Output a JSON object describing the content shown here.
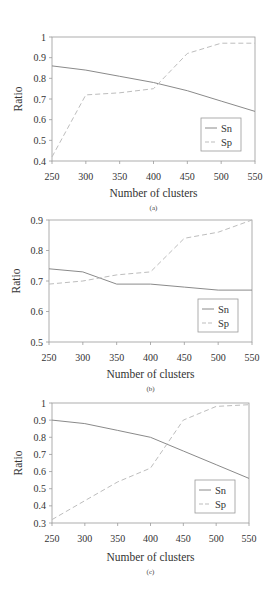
{
  "chart_data": [
    {
      "type": "line",
      "caption": "(a)",
      "title": "",
      "xlabel": "Number of clusters",
      "ylabel": "Ratio",
      "x": [
        250,
        300,
        350,
        400,
        450,
        500,
        550
      ],
      "ylim": [
        0.4,
        1.0
      ],
      "yticks": [
        "0.4",
        "0.5",
        "0.6",
        "0.7",
        "0.8",
        "0.9",
        "1"
      ],
      "xticks": [
        "250",
        "300",
        "350",
        "400",
        "450",
        "500",
        "550"
      ],
      "grid": false,
      "legend_position": "lower right",
      "series": [
        {
          "name": "Sn",
          "style": "solid",
          "values": [
            0.86,
            0.84,
            0.81,
            0.78,
            0.74,
            0.69,
            0.64
          ]
        },
        {
          "name": "Sp",
          "style": "dashed",
          "values": [
            0.42,
            0.72,
            0.73,
            0.75,
            0.92,
            0.97,
            0.97
          ]
        }
      ]
    },
    {
      "type": "line",
      "caption": "(b)",
      "title": "",
      "xlabel": "Number of clusters",
      "ylabel": "Ratio",
      "x": [
        250,
        300,
        350,
        400,
        450,
        500,
        550
      ],
      "ylim": [
        0.5,
        0.9
      ],
      "yticks": [
        "0.5",
        "0.6",
        "0.7",
        "0.8",
        "0.9"
      ],
      "xticks": [
        "250",
        "300",
        "350",
        "400",
        "450",
        "500",
        "550"
      ],
      "grid": false,
      "legend_position": "lower right",
      "series": [
        {
          "name": "Sn",
          "style": "solid",
          "values": [
            0.74,
            0.73,
            0.69,
            0.69,
            0.68,
            0.67,
            0.67
          ]
        },
        {
          "name": "Sp",
          "style": "dashed",
          "values": [
            0.69,
            0.7,
            0.72,
            0.73,
            0.84,
            0.86,
            0.9
          ]
        }
      ]
    },
    {
      "type": "line",
      "caption": "(c)",
      "title": "",
      "xlabel": "Number of clusters",
      "ylabel": "Ratio",
      "x": [
        250,
        300,
        350,
        400,
        450,
        500,
        550
      ],
      "ylim": [
        0.3,
        1.0
      ],
      "yticks": [
        "0.3",
        "0.4",
        "0.5",
        "0.6",
        "0.7",
        "0.8",
        "0.9",
        "1"
      ],
      "xticks": [
        "250",
        "300",
        "350",
        "400",
        "450",
        "500",
        "550"
      ],
      "grid": false,
      "legend_position": "lower right",
      "series": [
        {
          "name": "Sn",
          "style": "solid",
          "values": [
            0.9,
            0.88,
            0.84,
            0.8,
            0.72,
            0.64,
            0.56
          ]
        },
        {
          "name": "Sp",
          "style": "dashed",
          "values": [
            0.32,
            0.43,
            0.54,
            0.62,
            0.9,
            0.98,
            0.99
          ]
        }
      ]
    }
  ],
  "colors": {
    "sn_line": "#8a8a8a",
    "sp_line": "#bdbdbd",
    "axis": "#9a9a9a",
    "text": "#333333"
  }
}
